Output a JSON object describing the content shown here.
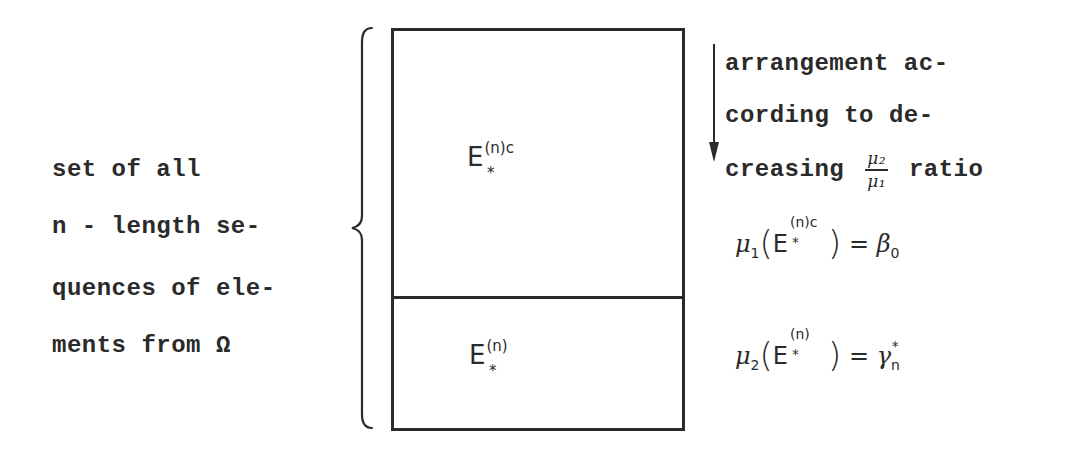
{
  "left_description": {
    "lines": [
      "set of all",
      "n - length se-",
      "quences of ele-",
      "ments from Ω"
    ]
  },
  "regions": {
    "upper": {
      "base": "E",
      "superscript": "(n)c",
      "subscript": "*"
    },
    "lower": {
      "base": "E",
      "superscript": "(n)",
      "subscript": "*"
    }
  },
  "arrow_annotation": {
    "lines": [
      "arrangement ac-",
      "cording to de-",
      "creasing"
    ],
    "fraction": {
      "numerator": "μ₂",
      "denominator": "μ₁"
    },
    "suffix": "ratio"
  },
  "formulas": {
    "upper": {
      "measure": "μ",
      "measure_index": "1",
      "set_base": "E",
      "set_superscript": "(n)c",
      "set_subscript": "*",
      "equals": "=",
      "value": "β",
      "value_subscript": "0"
    },
    "lower": {
      "measure": "μ",
      "measure_index": "2",
      "set_base": "E",
      "set_superscript": "(n)",
      "set_subscript": "*",
      "equals": "=",
      "value": "γ",
      "value_subscript": "n",
      "value_superscript": "*"
    }
  },
  "colors": {
    "ink": "#2a2a2a",
    "background": "#ffffff"
  }
}
